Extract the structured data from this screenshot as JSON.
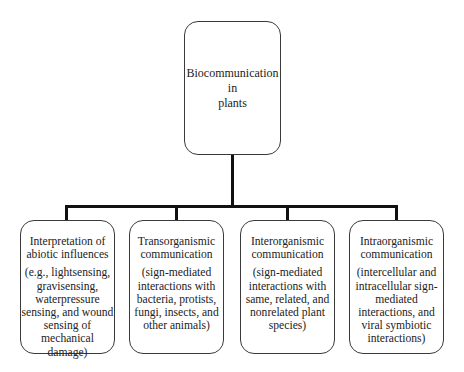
{
  "diagram": {
    "type": "tree",
    "root": {
      "label": "Biocommunication\nin\nplants"
    },
    "children": [
      {
        "title": "Interpretation of\nabiotic influences",
        "description": "(e.g., lightsensing,\ngravisensing,\nwaterpressure\nsensing, and wound\nsensing of\nmechanical damage)"
      },
      {
        "title": "Transorganismic\ncommunication",
        "description": "(sign-mediated\ninteractions with\nbacteria, protists,\nfungi, insects, and\nother animals)"
      },
      {
        "title": "Interorganismic\ncommunication",
        "description": "(sign-mediated\ninteractions with\nsame, related, and\nnonrelated plant\nspecies)"
      },
      {
        "title": "Intraorganismic\ncommunication",
        "description": "(intercellular and\nintracellular sign-\nmediated\ninteractions, and\nviral symbiotic\ninteractions)"
      }
    ],
    "colors": {
      "box_border": "#3a3a3a",
      "connector": "#111111",
      "text": "#222222",
      "background": "#ffffff"
    }
  }
}
